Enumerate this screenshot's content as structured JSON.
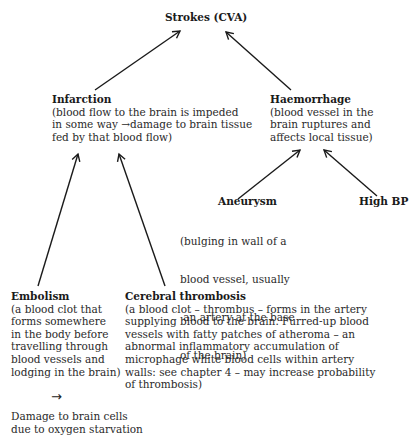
{
  "diagram": {
    "root": {
      "title": "Strokes (CVA)"
    },
    "infarction": {
      "title": "Infarction",
      "desc_lines": [
        "(blood flow to the brain is impeded",
        "in some way →damage to brain tissue",
        "fed by that blood flow)"
      ]
    },
    "haemorrhage": {
      "title": "Haemorrhage",
      "desc_lines": [
        "(blood vessel in the",
        "brain ruptures and",
        "affects local tissue)"
      ]
    },
    "aneurysm": {
      "title": "Aneurysm",
      "desc_lines": [
        "(bulging in wall of a",
        "blood vessel, usually",
        " an artery at the base",
        "of the brain)"
      ]
    },
    "high_bp": {
      "title": "High BP"
    },
    "embolism": {
      "title": "Embolism",
      "desc_lines": [
        "(a blood clot that",
        "forms somewhere",
        "in the body before",
        "travelling through",
        "blood vessels and",
        "lodging in the brain)"
      ]
    },
    "cerebral_thrombosis": {
      "title": "Cerebral thrombosis",
      "desc_lines": [
        "(a blood clot – thrombus – forms in the artery",
        "supplying blood to the brain. Furred-up blood",
        "vessels with fatty patches of atheroma – an",
        "abnormal inflammatory accumulation of",
        "microphage white blood cells within artery",
        "walls: see chapter 4 – may increase probability",
        "of thrombosis)"
      ]
    },
    "outcome": {
      "arrow_glyph": "→",
      "lines": [
        "Damage to brain cells",
        "due to oxygen starvation"
      ]
    },
    "edges": [
      {
        "from": "infarction",
        "to": "root"
      },
      {
        "from": "haemorrhage",
        "to": "root"
      },
      {
        "from": "aneurysm",
        "to": "haemorrhage"
      },
      {
        "from": "high_bp",
        "to": "haemorrhage"
      },
      {
        "from": "embolism",
        "to": "infarction"
      },
      {
        "from": "cerebral_thrombosis",
        "to": "infarction"
      }
    ]
  }
}
